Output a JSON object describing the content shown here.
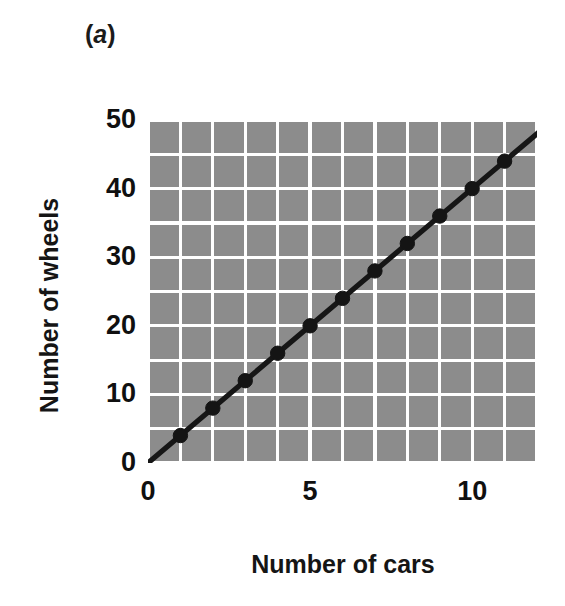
{
  "figure": {
    "panel_label_open": "(",
    "panel_label_letter": "a",
    "panel_label_close": ")",
    "panel_label_full": "(a)"
  },
  "chart_data": {
    "type": "line",
    "title": "",
    "subtitle": "",
    "xlabel": "Number of cars",
    "ylabel": "Number of wheels",
    "x": [
      1,
      2,
      3,
      4,
      5,
      6,
      7,
      8,
      9,
      10,
      11
    ],
    "values": [
      4,
      8,
      12,
      16,
      20,
      24,
      28,
      32,
      36,
      40,
      44
    ],
    "series": [
      {
        "name": "Number of wheels",
        "x": [
          1,
          2,
          3,
          4,
          5,
          6,
          7,
          8,
          9,
          10,
          11
        ],
        "values": [
          4,
          8,
          12,
          16,
          20,
          24,
          28,
          32,
          36,
          40,
          44
        ]
      }
    ],
    "line_fit": {
      "slope": 4,
      "intercept": 0,
      "x_start": 0,
      "x_end": 12,
      "y_start": 0,
      "y_end": 48
    },
    "xlim": [
      0,
      12
    ],
    "ylim": [
      0,
      50
    ],
    "xticks": [
      0,
      5,
      10
    ],
    "xtick_labels": [
      "0",
      "5",
      "10"
    ],
    "yticks": [
      0,
      10,
      20,
      30,
      40,
      50
    ],
    "ytick_labels": [
      "0",
      "10",
      "20",
      "30",
      "40",
      "50"
    ],
    "x_gridlines": [
      0,
      1,
      2,
      3,
      4,
      5,
      6,
      7,
      8,
      9,
      10,
      11,
      12
    ],
    "y_gridlines": [
      0,
      5,
      10,
      15,
      20,
      25,
      30,
      35,
      40,
      45,
      50
    ],
    "grid": true,
    "grid_color": "#ffffff",
    "plot_background": "#8c8c8c",
    "line_color": "#161616",
    "marker_color": "#141414",
    "marker": "circle",
    "legend": null,
    "legend_position": "none"
  }
}
